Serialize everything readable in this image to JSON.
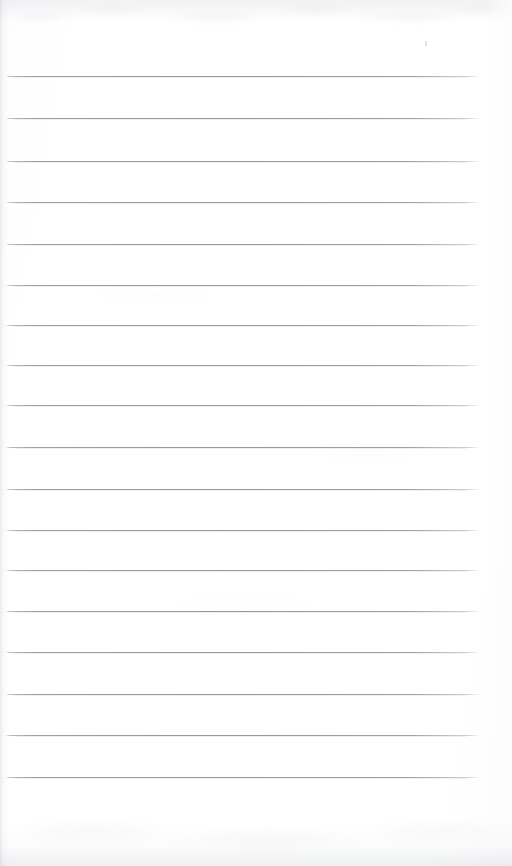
{
  "page": {
    "kind": "scanned-blank-lined-notebook-page",
    "width_px": 512,
    "height_px": 866,
    "paper_color": "#ffffff",
    "rule_color": "#8f95a1",
    "edge_shadow_color": "#aab0ba",
    "text_content": "",
    "handwriting_present": "no",
    "printed_text_present": "no"
  },
  "ruling": {
    "line_count": 18,
    "line_spacing_px": 41,
    "line_thickness_px": 1,
    "line_start_x_px": 5,
    "line_end_x_px": 480,
    "left_margin_px": 5,
    "right_margin_px": 32,
    "top_margin_px": 76,
    "bottom_margin_px": 48,
    "margin_rule_present": "no",
    "lines_y_px": [
      76,
      118,
      161,
      202,
      244,
      285,
      325,
      365,
      405,
      447,
      489,
      530,
      570,
      611,
      652,
      694,
      735,
      777
    ]
  },
  "artifacts": {
    "speck": {
      "x_px": 425,
      "y_px": 41,
      "width_px": 2,
      "height_px": 5
    }
  },
  "labels": {
    "page_label": "Blank ruled page",
    "writing_area_label": "Writing area"
  }
}
